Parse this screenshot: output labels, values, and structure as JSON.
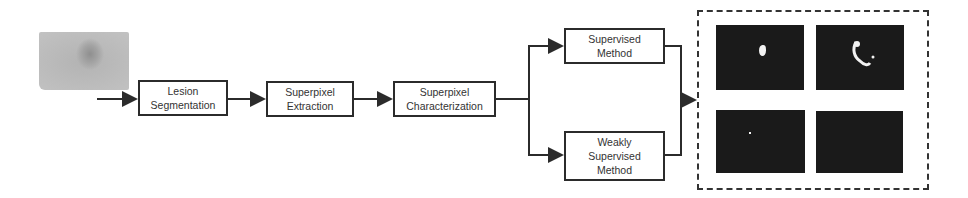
{
  "diagram": {
    "type": "pipeline-flowchart",
    "input_image": {
      "description": "grayscale skin lesion photo"
    },
    "steps": [
      {
        "id": "lesion_segmentation",
        "lines": [
          "Lesion",
          "Segmentation"
        ]
      },
      {
        "id": "superpixel_extraction",
        "lines": [
          "Superpixel",
          "Extraction"
        ]
      },
      {
        "id": "superpixel_characterization",
        "lines": [
          "Superpixel",
          "Characterization"
        ]
      }
    ],
    "branches": [
      {
        "id": "supervised_method",
        "lines": [
          "Supervised",
          "Method"
        ]
      },
      {
        "id": "weakly_supervised_method",
        "lines": [
          "Weakly",
          "Supervised",
          "Method"
        ]
      }
    ],
    "output": {
      "description": "dashed group of four binary segmentation masks",
      "masks": [
        "mask-1",
        "mask-2",
        "mask-3",
        "mask-4"
      ]
    },
    "colors": {
      "stroke": "#2b2b2b",
      "mask_bg": "#1a1a1a",
      "text": "#333333"
    }
  }
}
